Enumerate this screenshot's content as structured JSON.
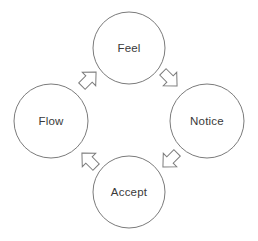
{
  "diagram": {
    "type": "cycle",
    "title": "",
    "direction": "clockwise",
    "background_color": "#ffffff",
    "stroke_color": "#7b7b7b",
    "text_color": "#3a3a3a",
    "nodes": [
      {
        "id": "feel",
        "label": "Feel",
        "position": "top",
        "cx": 129,
        "cy": 48,
        "r": 36
      },
      {
        "id": "notice",
        "label": "Notice",
        "position": "right",
        "cx": 207,
        "cy": 121,
        "r": 37
      },
      {
        "id": "accept",
        "label": "Accept",
        "position": "bottom",
        "cx": 129,
        "cy": 192,
        "r": 36
      },
      {
        "id": "flow",
        "label": "Flow",
        "position": "left",
        "cx": 51,
        "cy": 121,
        "r": 37
      }
    ],
    "arrows": [
      {
        "id": "feel-to-notice",
        "from": "feel",
        "to": "notice",
        "points_toward": "down-right",
        "cx": 170,
        "cy": 79,
        "rotation": 135
      },
      {
        "id": "notice-to-accept",
        "from": "notice",
        "to": "accept",
        "points_toward": "down-left",
        "cx": 170,
        "cy": 160,
        "rotation": 225
      },
      {
        "id": "accept-to-flow",
        "from": "accept",
        "to": "flow",
        "points_toward": "up-left",
        "cx": 89,
        "cy": 160,
        "rotation": 315
      },
      {
        "id": "flow-to-feel",
        "from": "flow",
        "to": "feel",
        "points_toward": "up-right",
        "cx": 89,
        "cy": 79,
        "rotation": 45
      }
    ]
  }
}
